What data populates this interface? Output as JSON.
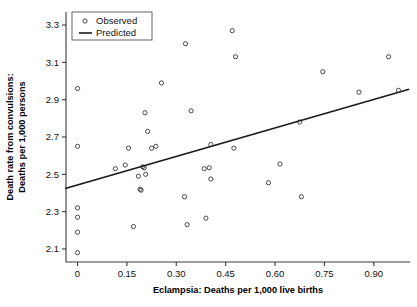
{
  "chart_data": {
    "type": "scatter",
    "title": "",
    "xlabel": "Eclampsia: Deaths per 1,000 live births",
    "ylabel_line1": "Death rate from convulsions:",
    "ylabel_line2": "Deaths per 1,000 persons",
    "xlim": [
      -0.035,
      1.01
    ],
    "ylim": [
      2.03,
      3.37
    ],
    "grid": false,
    "legend_position": "top-left-inside",
    "xticks": [
      0,
      0.15,
      0.3,
      0.45,
      0.6,
      0.75,
      0.9
    ],
    "xtick_labels": [
      "0",
      "0.15",
      "0.30",
      "0.45",
      "0.60",
      "0.75",
      "0.90"
    ],
    "yticks": [
      2.1,
      2.3,
      2.5,
      2.7,
      2.9,
      3.1,
      3.3
    ],
    "ytick_labels": [
      "2.1",
      "2.3",
      "2.5",
      "2.7",
      "2.9",
      "3.1",
      "3.3"
    ],
    "series": [
      {
        "name": "Observed",
        "type": "scatter",
        "marker": "open-circle",
        "color": "#2b2b2b",
        "points": [
          [
            0.0,
            2.96
          ],
          [
            0.0,
            2.65
          ],
          [
            0.0,
            2.32
          ],
          [
            0.0,
            2.27
          ],
          [
            0.0,
            2.19
          ],
          [
            0.0,
            2.08
          ],
          [
            0.115,
            2.53
          ],
          [
            0.145,
            2.55
          ],
          [
            0.155,
            2.64
          ],
          [
            0.17,
            2.22
          ],
          [
            0.185,
            2.49
          ],
          [
            0.19,
            2.42
          ],
          [
            0.193,
            2.415
          ],
          [
            0.198,
            2.54
          ],
          [
            0.203,
            2.535
          ],
          [
            0.205,
            2.83
          ],
          [
            0.207,
            2.5
          ],
          [
            0.213,
            2.73
          ],
          [
            0.225,
            2.64
          ],
          [
            0.238,
            2.65
          ],
          [
            0.255,
            2.99
          ],
          [
            0.325,
            2.38
          ],
          [
            0.328,
            3.2
          ],
          [
            0.333,
            2.23
          ],
          [
            0.345,
            2.84
          ],
          [
            0.385,
            2.53
          ],
          [
            0.39,
            2.265
          ],
          [
            0.4,
            2.535
          ],
          [
            0.405,
            2.475
          ],
          [
            0.405,
            2.66
          ],
          [
            0.47,
            3.27
          ],
          [
            0.475,
            2.64
          ],
          [
            0.48,
            3.13
          ],
          [
            0.58,
            2.455
          ],
          [
            0.615,
            2.555
          ],
          [
            0.675,
            2.78
          ],
          [
            0.68,
            2.38
          ],
          [
            0.745,
            3.05
          ],
          [
            0.855,
            2.94
          ],
          [
            0.945,
            3.13
          ],
          [
            0.975,
            2.95
          ]
        ]
      },
      {
        "name": "Predicted",
        "type": "line",
        "color": "#1a1a1a",
        "endpoints": [
          [
            -0.035,
            2.425
          ],
          [
            1.005,
            2.955
          ]
        ]
      }
    ]
  },
  "legend": {
    "items": [
      {
        "label": "Observed",
        "marker": "open-circle"
      },
      {
        "label": "Predicted",
        "marker": "line"
      }
    ]
  },
  "icons": {
    "observed_marker": "open-circle-marker-icon",
    "predicted_marker": "line-segment-icon"
  }
}
